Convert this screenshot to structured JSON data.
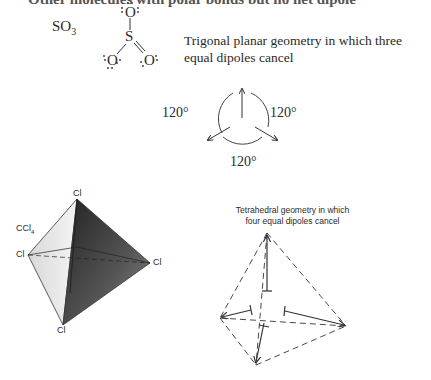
{
  "page": {
    "cut_heading": "Other molecules with polar bonds but no net dipole"
  },
  "so3_example": {
    "formula_main": "SO",
    "formula_sub": "3",
    "atoms": {
      "top_oxygen": "O",
      "center_sulfur": "S",
      "left_oxygen": "O",
      "right_oxygen": "O"
    },
    "caption": "Trigonal planar geometry in which three equal dipoles cancel",
    "angles": [
      "120°",
      "120°",
      "120°"
    ]
  },
  "ccl4_example": {
    "formula_main": "CCl",
    "formula_sub": "4",
    "atoms": {
      "top": "Cl",
      "left": "Cl",
      "right": "Cl",
      "bottom": "Cl"
    },
    "caption_line1": "Tetrahedral geometry in which",
    "caption_line2": "four equal dipoles cancel"
  }
}
